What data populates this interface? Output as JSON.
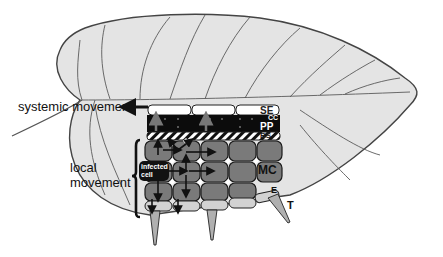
{
  "figure": {
    "type": "leaf-cross-section-diagram"
  },
  "labels": {
    "systemic_movement": "systemic movement",
    "local_movement_line1": "local",
    "local_movement_line2": "movement",
    "infected_cell_line1": "infected",
    "infected_cell_line2": "cell"
  },
  "tissue_tags": {
    "se": "SE",
    "cc": "CC",
    "pp": "PP",
    "bs": "BS",
    "mc": "MC",
    "e": "E",
    "t": "T"
  },
  "colors": {
    "leaf_fill": "#e4e4e4",
    "leaf_outline": "#444444",
    "vein": "#5a5a5a",
    "mesophyll": "#7a7a7a",
    "phloem_black": "#0c0c0c",
    "sieve_element": "#ffffff",
    "epidermis": "#d2d2d2",
    "arrow": "#111111"
  }
}
